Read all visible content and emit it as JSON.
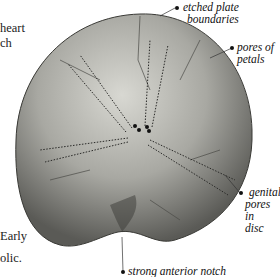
{
  "figure": {
    "body_text_fragments": [
      "heart",
      "ch",
      "Early",
      "olic."
    ],
    "annotations": [
      {
        "id": "etched-plate-boundaries",
        "line1": "etched plate",
        "line2": "boundaries"
      },
      {
        "id": "pores-of-petals",
        "line1": "pores of petals"
      },
      {
        "id": "genital-pores",
        "line1": "genital",
        "line2": "pores in",
        "line3": "disc"
      },
      {
        "id": "anterior-notch",
        "line1": "strong anterior notch"
      }
    ],
    "colors": {
      "background": "#ffffff",
      "fossil_light": "#d2d2cc",
      "fossil_mid": "#9a9a94",
      "fossil_dark": "#4a4a46",
      "text": "#111111"
    }
  }
}
